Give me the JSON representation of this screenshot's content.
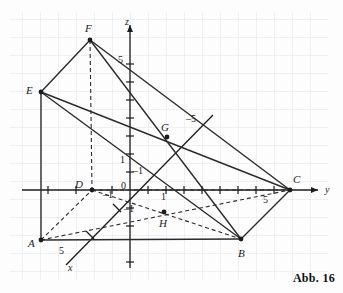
{
  "figure": {
    "caption": "Abb. 16",
    "background_color": "#fdfdfd",
    "grid_color": "#d8dce4",
    "grid_spacing_px": 18,
    "line_color": "#2b2b2b",
    "axis_color": "#1b1b1b"
  },
  "axes": {
    "origin_label": "0",
    "x": {
      "name": "x",
      "label_x": 70,
      "label_y": 269,
      "tick_label": "5",
      "tick_label_x": 60,
      "tick_label_y": 252
    },
    "y": {
      "name": "y",
      "label_x": 326,
      "label_y": 190,
      "tick_label": "5",
      "tick_label_x": 265,
      "tick_label_y": 201
    },
    "z": {
      "name": "z",
      "label_x": 126,
      "label_y": 23,
      "tick_label": "5",
      "tick_label_x": 119,
      "tick_label_y": 62
    },
    "unit_ticks": [
      {
        "label": "1",
        "x": 122,
        "y": 161,
        "axis": "z-unit"
      },
      {
        "label": "1",
        "x": 134,
        "y": 172,
        "axis": "x-positive-unit"
      },
      {
        "label": "1",
        "x": 163,
        "y": 198,
        "axis": "y-unit"
      },
      {
        "label": "1",
        "x": 105,
        "y": 196,
        "axis": "x-negative-unit-minus",
        "text": "-1"
      },
      {
        "label": "1",
        "x": 127,
        "y": 210,
        "axis": "z-negative-unit",
        "text": "-1"
      }
    ],
    "negative_x_label": {
      "text": "5",
      "x": 190,
      "y": 120,
      "prefix": "-"
    }
  },
  "points": [
    {
      "name": "A",
      "x": 41,
      "y": 240,
      "label_x": 28,
      "label_y": 244,
      "marker": true
    },
    {
      "name": "B",
      "x": 241,
      "y": 239,
      "label_x": 238,
      "label_y": 254,
      "marker": true
    },
    {
      "name": "C",
      "x": 290,
      "y": 190,
      "label_x": 293,
      "label_y": 180,
      "marker": true
    },
    {
      "name": "D",
      "x": 92,
      "y": 190,
      "label_x": 76,
      "label_y": 186,
      "marker": true
    },
    {
      "name": "E",
      "x": 41,
      "y": 92,
      "label_x": 27,
      "label_y": 92,
      "marker": true
    },
    {
      "name": "F",
      "x": 90,
      "y": 40,
      "label_x": 86,
      "label_y": 30,
      "marker": true
    },
    {
      "name": "G",
      "x": 167,
      "y": 137,
      "label_x": 162,
      "label_y": 128,
      "marker": true
    },
    {
      "name": "H",
      "x": 164,
      "y": 212,
      "label_x": 160,
      "label_y": 226,
      "marker": true
    }
  ],
  "solid_segments": [
    {
      "name": "E-F",
      "from": "E",
      "to": "F"
    },
    {
      "name": "E-A",
      "from": "E",
      "to": "A"
    },
    {
      "name": "E-B",
      "from": "E",
      "to": "B"
    },
    {
      "name": "E-C",
      "from": "E",
      "to": "C"
    },
    {
      "name": "F-B",
      "from": "F",
      "to": "B"
    },
    {
      "name": "F-C",
      "from": "F",
      "to": "C"
    },
    {
      "name": "A-B",
      "from": "A",
      "to": "B"
    },
    {
      "name": "B-C",
      "from": "B",
      "to": "C"
    }
  ],
  "dashed_segments": [
    {
      "name": "F-D",
      "from": "F",
      "to": "D"
    },
    {
      "name": "A-D",
      "from": "A",
      "to": "D"
    },
    {
      "name": "D-C",
      "from": "D",
      "to": "C"
    },
    {
      "name": "A-C",
      "from": "A",
      "to": "C"
    },
    {
      "name": "D-B",
      "from": "D",
      "to": "B"
    }
  ]
}
